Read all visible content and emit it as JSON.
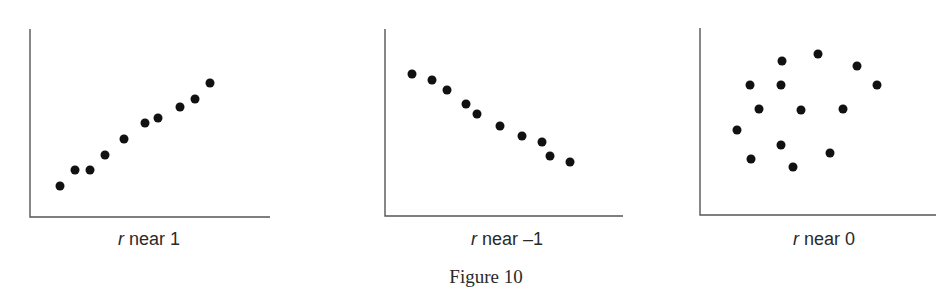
{
  "figure": {
    "caption": "Figure 10",
    "axis_color": "#555555",
    "dot_color": "#111111",
    "dot_radius": 4.5
  },
  "chart_data": [
    {
      "type": "scatter",
      "title": "",
      "label_var": "r",
      "label_text": " near 1",
      "xlabel": "r near 1",
      "ylabel": "",
      "grid": false,
      "ticks": false,
      "axes": {
        "x0": 30,
        "y_top": 29,
        "y_axis": 217,
        "x_end": 270
      },
      "label_x": 149,
      "points": [
        [
          60,
          186
        ],
        [
          75,
          170
        ],
        [
          90,
          170
        ],
        [
          105,
          155
        ],
        [
          124,
          139
        ],
        [
          145,
          123
        ],
        [
          158,
          118
        ],
        [
          180,
          107
        ],
        [
          195,
          99
        ],
        [
          210,
          83
        ]
      ]
    },
    {
      "type": "scatter",
      "title": "",
      "label_var": "r",
      "label_text": " near –1",
      "xlabel": "r near –1",
      "ylabel": "",
      "grid": false,
      "ticks": false,
      "axes": {
        "x0": 385,
        "y_top": 29,
        "y_axis": 216,
        "x_end": 623
      },
      "label_x": 507,
      "points": [
        [
          412,
          74
        ],
        [
          432,
          80
        ],
        [
          447,
          90
        ],
        [
          466,
          104
        ],
        [
          477,
          114
        ],
        [
          500,
          126
        ],
        [
          522,
          136
        ],
        [
          542,
          142
        ],
        [
          550,
          156
        ],
        [
          570,
          162
        ]
      ]
    },
    {
      "type": "scatter",
      "title": "",
      "label_var": "r",
      "label_text": " near 0",
      "xlabel": "r near 0",
      "ylabel": "",
      "grid": false,
      "ticks": false,
      "axes": {
        "x0": 700,
        "y_top": 28,
        "y_axis": 215,
        "x_end": 936
      },
      "label_x": 824,
      "points": [
        [
          782,
          61
        ],
        [
          818,
          54
        ],
        [
          857,
          66
        ],
        [
          750,
          85
        ],
        [
          781,
          85
        ],
        [
          877,
          85
        ],
        [
          759,
          109
        ],
        [
          801,
          110
        ],
        [
          843,
          109
        ],
        [
          737,
          130
        ],
        [
          781,
          145
        ],
        [
          751,
          159
        ],
        [
          793,
          167
        ],
        [
          830,
          153
        ]
      ]
    }
  ]
}
